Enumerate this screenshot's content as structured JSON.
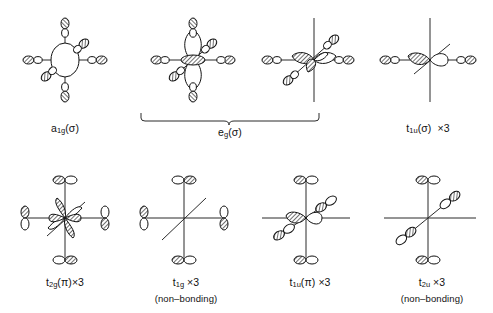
{
  "figure": {
    "background_color": "#ffffff",
    "line_color": "#2b2b2b",
    "rows": 2,
    "columns": 4
  },
  "grouping_brace": {
    "label": "eg-brace",
    "spans_items": [
      "eg-1",
      "eg-2"
    ],
    "caption_index": 1
  },
  "orbitals": [
    {
      "id": "a1g",
      "row": 0,
      "col": 0,
      "symbol": "a",
      "sub": "1g",
      "suffix": "(σ)",
      "multiplicity": "",
      "note": "",
      "central": "s-orbital",
      "axes": [
        "vertical",
        "horizontal",
        "diagonal"
      ],
      "ligand_type": "sigma",
      "ligand_count": 6
    },
    {
      "id": "eg-1",
      "row": 0,
      "col": 1,
      "symbol": "",
      "sub": "",
      "suffix": "",
      "multiplicity": "",
      "note": "",
      "central": "dz2-orbital",
      "axes": [
        "vertical",
        "horizontal",
        "diagonal"
      ],
      "ligand_type": "sigma",
      "ligand_count": 6
    },
    {
      "id": "eg-2",
      "row": 0,
      "col": 2,
      "symbol": "",
      "sub": "",
      "suffix": "",
      "multiplicity": "",
      "note": "",
      "central": "dx2y2-orbital",
      "axes": [
        "vertical",
        "horizontal",
        "diagonal"
      ],
      "ligand_type": "sigma",
      "ligand_count": 4
    },
    {
      "id": "t1u-sigma",
      "row": 0,
      "col": 3,
      "symbol": "t",
      "sub": "1u",
      "suffix": "(σ)",
      "multiplicity": "×3",
      "note": "",
      "central": "p-orbital-horizontal",
      "axes": [
        "vertical",
        "horizontal",
        "diagonal"
      ],
      "ligand_type": "sigma",
      "ligand_count": 2
    },
    {
      "id": "t2g-pi",
      "row": 1,
      "col": 0,
      "symbol": "t",
      "sub": "2g",
      "suffix": "(π)",
      "multiplicity": "×3",
      "note": "",
      "central": "d-orbital-cloverleaf",
      "axes": [
        "vertical",
        "horizontal",
        "diagonal"
      ],
      "ligand_type": "pi",
      "ligand_count": 4
    },
    {
      "id": "t1g",
      "row": 1,
      "col": 1,
      "symbol": "t",
      "sub": "1g",
      "suffix": "",
      "multiplicity": "×3",
      "note": "(non–bonding)",
      "central": "none",
      "axes": [
        "vertical",
        "horizontal",
        "diagonal"
      ],
      "ligand_type": "pi",
      "ligand_count": 4
    },
    {
      "id": "t1u-pi",
      "row": 1,
      "col": 2,
      "symbol": "t",
      "sub": "1u",
      "suffix": "(π)",
      "multiplicity": "×3",
      "note": "",
      "central": "p-orbital-horizontal",
      "axes": [
        "vertical",
        "horizontal",
        "diagonal"
      ],
      "ligand_type": "pi",
      "ligand_count": 4
    },
    {
      "id": "t2u",
      "row": 1,
      "col": 3,
      "symbol": "t",
      "sub": "2u",
      "suffix": "",
      "multiplicity": "×3",
      "note": "(non–bonding)",
      "central": "none",
      "axes": [
        "vertical",
        "horizontal",
        "diagonal"
      ],
      "ligand_type": "pi",
      "ligand_count": 4
    }
  ],
  "captions": [
    {
      "symbol": "a",
      "sub": "1g",
      "suffix": "(σ)",
      "multiplicity": "",
      "note": ""
    },
    {
      "symbol": "e",
      "sub": "g",
      "suffix": "(σ)",
      "multiplicity": "",
      "note": ""
    },
    {
      "symbol": "t",
      "sub": "1u",
      "suffix": "(σ)",
      "multiplicity": "×3",
      "note": ""
    },
    {
      "symbol": "t",
      "sub": "2g",
      "suffix": "(π)",
      "multiplicity": "×3",
      "note": ""
    },
    {
      "symbol": "t",
      "sub": "1g",
      "suffix": "",
      "multiplicity": "×3",
      "note": "(non–bonding)"
    },
    {
      "symbol": "t",
      "sub": "1u",
      "suffix": "(π)",
      "multiplicity": "×3",
      "note": ""
    },
    {
      "symbol": "t",
      "sub": "2u",
      "suffix": "",
      "multiplicity": "×3",
      "note": "(non–bonding)"
    }
  ]
}
